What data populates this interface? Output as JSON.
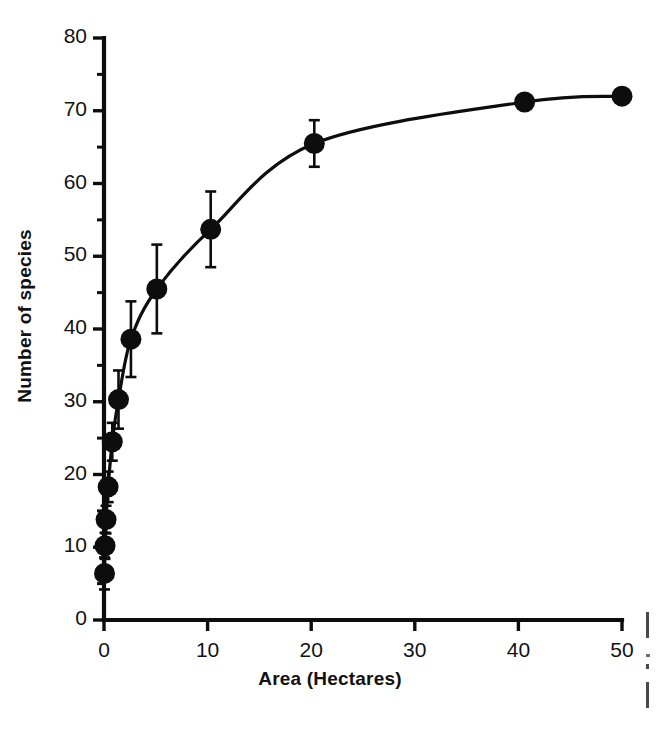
{
  "chart_data": {
    "type": "line",
    "title": "",
    "subtitle": "",
    "xlabel": "Area (Hectares)",
    "ylabel": "Number of species",
    "xlim": [
      0,
      50
    ],
    "ylim": [
      0,
      80
    ],
    "xticks": [
      0,
      10,
      20,
      30,
      40,
      50
    ],
    "yticks": [
      0,
      10,
      20,
      30,
      40,
      50,
      60,
      70,
      80
    ],
    "xtick_labels": [
      "0",
      "10",
      "20",
      "30",
      "40",
      "50"
    ],
    "ytick_labels": [
      "0",
      "10",
      "20",
      "30",
      "40",
      "50",
      "60",
      "70",
      "80"
    ],
    "x_minor_ticks": [],
    "y_minor_ticks": [
      5,
      15,
      25,
      35,
      45,
      55,
      65,
      75
    ],
    "grid": false,
    "legend": null,
    "marker": "filled-circle",
    "marker_color": "#0d0d0d",
    "line_color": "#0d0d0d",
    "error_bar_color": "#0d0d0d",
    "series": [
      {
        "name": "Number of species",
        "x": [
          0.05,
          0.1,
          0.2,
          0.4,
          0.8,
          1.4,
          2.6,
          5.1,
          10.3,
          20.3,
          40.6,
          50.0
        ],
        "y": [
          6.4,
          10.2,
          13.8,
          18.3,
          24.5,
          30.3,
          38.6,
          45.5,
          53.7,
          65.5,
          71.2,
          72.0
        ],
        "yerr_lower": [
          2.2,
          1.8,
          1.9,
          2.1,
          2.6,
          4.0,
          5.2,
          6.1,
          5.2,
          3.2,
          0,
          0
        ],
        "yerr_upper": [
          2.2,
          1.8,
          1.9,
          2.1,
          2.6,
          4.0,
          5.2,
          6.1,
          5.2,
          3.2,
          0,
          0
        ]
      }
    ],
    "point_labels": [],
    "annotations": []
  },
  "axis_titles": {
    "x": "Area (Hectares)",
    "y": "Number of species"
  },
  "caption_fragment": {
    "visible": true,
    "note": "partially cropped text at right edge"
  }
}
